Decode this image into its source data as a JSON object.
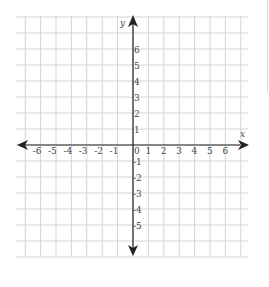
{
  "chart_data": {
    "type": "scatter",
    "title": "",
    "xlabel": "x",
    "ylabel": "y",
    "xlim": [
      -7,
      7
    ],
    "ylim": [
      -7,
      7
    ],
    "grid": true,
    "x_ticks": [
      -6,
      -5,
      -4,
      -3,
      -2,
      -1,
      0,
      1,
      2,
      3,
      4,
      5,
      6
    ],
    "y_ticks": [
      6,
      5,
      4,
      3,
      2,
      1,
      -1,
      -2,
      -3,
      -4,
      -5
    ],
    "x_tick_labels": [
      "-6",
      "-5",
      "-4",
      "-3",
      "-2",
      "-1",
      "0",
      "1",
      "2",
      "3",
      "4",
      "5",
      "6"
    ],
    "y_tick_labels": [
      "6",
      "5",
      "4",
      "3",
      "2",
      "1",
      "-1",
      "-2",
      "-3",
      "-4",
      "-5"
    ],
    "series": [],
    "legend": null
  },
  "axes": {
    "x_label": "x",
    "y_label": "y",
    "origin_label": "0"
  },
  "colors": {
    "grid": "#d4d4d4",
    "axis": "#222222",
    "labels": "#444444",
    "background": "#ffffff"
  }
}
